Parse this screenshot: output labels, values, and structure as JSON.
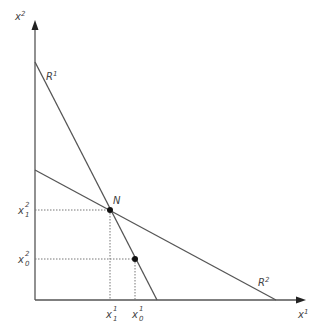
{
  "diagram": {
    "axes": {
      "x_label": "x",
      "x_label_sup": "1",
      "y_label": "x",
      "y_label_sup": "2",
      "color": "#555555"
    },
    "lines": [
      {
        "id": "R1",
        "label": "R",
        "label_sup": "1",
        "color": "#555555"
      },
      {
        "id": "R2",
        "label": "R",
        "label_sup": "2",
        "color": "#555555"
      }
    ],
    "points": [
      {
        "id": "N",
        "label": "N"
      },
      {
        "id": "P0",
        "label": ""
      }
    ],
    "x_ticks": [
      {
        "base": "x",
        "sup": "1",
        "sub": "1"
      },
      {
        "base": "x",
        "sup": "1",
        "sub": "0"
      }
    ],
    "y_ticks": [
      {
        "base": "x",
        "sup": "2",
        "sub": "1"
      },
      {
        "base": "x",
        "sup": "2",
        "sub": "0"
      }
    ]
  }
}
